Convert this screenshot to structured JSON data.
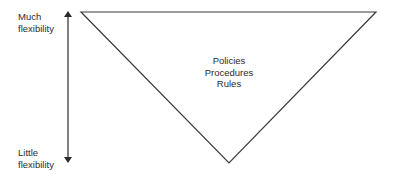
{
  "diagram": {
    "type": "inverted-triangle",
    "axis": {
      "direction": "vertical",
      "top_label": {
        "line1": "Much",
        "line2": "flexibility"
      },
      "bottom_label": {
        "line1": "Little",
        "line2": "flexibility"
      }
    },
    "triangle": {
      "contents": [
        "Policies",
        "Procedures",
        "Rules"
      ]
    },
    "colors": {
      "stroke": "#3a3a3a",
      "text": "#2a2a2a",
      "background": "#ffffff"
    }
  }
}
